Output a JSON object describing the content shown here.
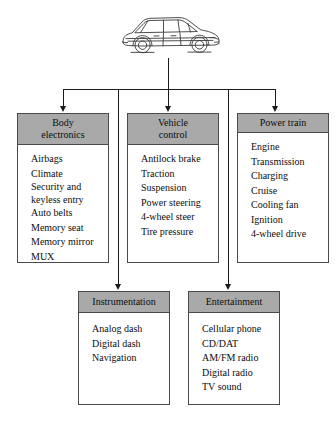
{
  "diagram": {
    "root": {
      "icon": "car-illustration",
      "label": "Automobile"
    },
    "colors": {
      "header_fill": "#a9a9a9",
      "box_border": "#4a4a4a",
      "connector": "#1a1a1a",
      "background": "#ffffff",
      "text": "#0d0d0d"
    },
    "nodes": [
      {
        "id": "body-electronics",
        "title_line1": "Body",
        "title_line2": "electronics",
        "items": [
          "Airbags",
          "Climate",
          "Security and keyless entry",
          "Auto belts",
          "Memory seat",
          "Memory mirror",
          "MUX"
        ]
      },
      {
        "id": "vehicle-control",
        "title_line1": "Vehicle",
        "title_line2": "control",
        "items": [
          "Antilock brake",
          "Traction",
          "Suspension",
          "Power steering",
          "4-wheel steer",
          "Tire pressure"
        ]
      },
      {
        "id": "power-train",
        "title_line1": "Power train",
        "title_line2": "",
        "items": [
          "Engine",
          "Transmission",
          "Charging",
          "Cruise",
          "Cooling fan",
          "Ignition",
          "4-wheel drive"
        ]
      },
      {
        "id": "instrumentation",
        "title_line1": "Instrumentation",
        "title_line2": "",
        "items": [
          "Analog dash",
          "Digital dash",
          "Navigation"
        ]
      },
      {
        "id": "entertainment",
        "title_line1": "Entertainment",
        "title_line2": "",
        "items": [
          "Cellular phone",
          "CD/DAT",
          "AM/FM radio",
          "Digital radio",
          "TV sound"
        ]
      }
    ]
  }
}
